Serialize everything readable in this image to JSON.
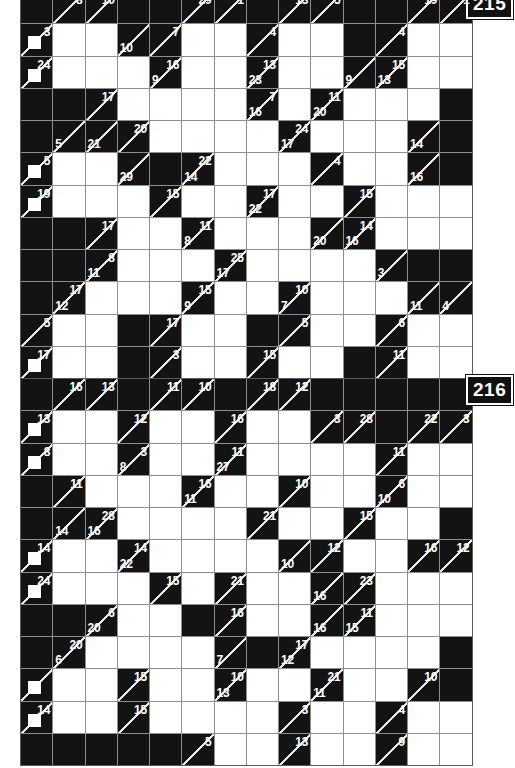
{
  "page": {
    "background_color": "#ffffff",
    "block_color": "#131313",
    "white_cell_color": "#ffffff",
    "grid_line_color": "#8e8e8e",
    "clue_text_color": "#ffffff"
  },
  "puzzles": [
    {
      "number": "215",
      "columns": 14,
      "rows": 12,
      "first_row_clipped": true,
      "cells": [
        [
          {
            "t": "b"
          },
          {
            "t": "c",
            "r": "8"
          },
          {
            "t": "c",
            "r": "10"
          },
          {
            "t": "b"
          },
          {
            "t": "b"
          },
          {
            "t": "c",
            "r": "29"
          },
          {
            "t": "c",
            "r": "1"
          },
          {
            "t": "b"
          },
          {
            "t": "c",
            "r": "13"
          },
          {
            "t": "c",
            "r": "5"
          },
          {
            "t": "b"
          },
          {
            "t": "b"
          },
          {
            "t": "c",
            "r": "19"
          },
          {
            "t": "c",
            "r": "1"
          }
        ],
        [
          {
            "t": "c",
            "r": "3",
            "nub": true
          },
          {
            "t": "w"
          },
          {
            "t": "w"
          },
          {
            "t": "c",
            "d": "10"
          },
          {
            "t": "c",
            "r": "7"
          },
          {
            "t": "w"
          },
          {
            "t": "w"
          },
          {
            "t": "c",
            "r": "4"
          },
          {
            "t": "w"
          },
          {
            "t": "w"
          },
          {
            "t": "b"
          },
          {
            "t": "c",
            "r": "4"
          },
          {
            "t": "w"
          },
          {
            "t": "w"
          }
        ],
        [
          {
            "t": "c",
            "r": "24",
            "nub": true
          },
          {
            "t": "w"
          },
          {
            "t": "w"
          },
          {
            "t": "w"
          },
          {
            "t": "c",
            "r": "16",
            "d": "9"
          },
          {
            "t": "w"
          },
          {
            "t": "w"
          },
          {
            "t": "c",
            "r": "13",
            "d": "23"
          },
          {
            "t": "w"
          },
          {
            "t": "w"
          },
          {
            "t": "c",
            "d": "9"
          },
          {
            "t": "c",
            "r": "15",
            "d": "13"
          },
          {
            "t": "w"
          },
          {
            "t": "w"
          }
        ],
        [
          {
            "t": "b"
          },
          {
            "t": "b"
          },
          {
            "t": "c",
            "r": "17"
          },
          {
            "t": "w"
          },
          {
            "t": "w"
          },
          {
            "t": "w"
          },
          {
            "t": "w"
          },
          {
            "t": "c",
            "r": "7",
            "d": "16"
          },
          {
            "t": "w"
          },
          {
            "t": "c",
            "r": "11",
            "d": "20"
          },
          {
            "t": "w"
          },
          {
            "t": "w"
          },
          {
            "t": "w"
          },
          {
            "t": "b"
          }
        ],
        [
          {
            "t": "b"
          },
          {
            "t": "c",
            "d": "5"
          },
          {
            "t": "c",
            "d": "21"
          },
          {
            "t": "c",
            "r": "20"
          },
          {
            "t": "w"
          },
          {
            "t": "w"
          },
          {
            "t": "w"
          },
          {
            "t": "w"
          },
          {
            "t": "c",
            "r": "24",
            "d": "17"
          },
          {
            "t": "w"
          },
          {
            "t": "w"
          },
          {
            "t": "w"
          },
          {
            "t": "c",
            "d": "14"
          },
          {
            "t": "b"
          }
        ],
        [
          {
            "t": "c",
            "r": "5",
            "nub": true
          },
          {
            "t": "w"
          },
          {
            "t": "w"
          },
          {
            "t": "c",
            "d": "29"
          },
          {
            "t": "b"
          },
          {
            "t": "c",
            "r": "22",
            "d": "14"
          },
          {
            "t": "w"
          },
          {
            "t": "w"
          },
          {
            "t": "w"
          },
          {
            "t": "c",
            "r": "4"
          },
          {
            "t": "w"
          },
          {
            "t": "w"
          },
          {
            "t": "c",
            "d": "16"
          },
          {
            "t": "b"
          }
        ],
        [
          {
            "t": "c",
            "r": "19",
            "nub": true
          },
          {
            "t": "w"
          },
          {
            "t": "w"
          },
          {
            "t": "w"
          },
          {
            "t": "c",
            "r": "15"
          },
          {
            "t": "w"
          },
          {
            "t": "w"
          },
          {
            "t": "c",
            "r": "17",
            "d": "22"
          },
          {
            "t": "w"
          },
          {
            "t": "w"
          },
          {
            "t": "c",
            "r": "15"
          },
          {
            "t": "w"
          },
          {
            "t": "w"
          },
          {
            "t": "w"
          }
        ],
        [
          {
            "t": "b"
          },
          {
            "t": "b"
          },
          {
            "t": "c",
            "r": "17"
          },
          {
            "t": "w"
          },
          {
            "t": "w"
          },
          {
            "t": "c",
            "r": "11",
            "d": "8"
          },
          {
            "t": "w"
          },
          {
            "t": "w"
          },
          {
            "t": "w"
          },
          {
            "t": "c",
            "d": "20"
          },
          {
            "t": "c",
            "r": "14",
            "d": "16"
          },
          {
            "t": "w"
          },
          {
            "t": "w"
          },
          {
            "t": "w"
          }
        ],
        [
          {
            "t": "b"
          },
          {
            "t": "b"
          },
          {
            "t": "c",
            "r": "8",
            "d": "11"
          },
          {
            "t": "w"
          },
          {
            "t": "w"
          },
          {
            "t": "w"
          },
          {
            "t": "c",
            "r": "25",
            "d": "17"
          },
          {
            "t": "w"
          },
          {
            "t": "w"
          },
          {
            "t": "w"
          },
          {
            "t": "w"
          },
          {
            "t": "c",
            "d": "3"
          },
          {
            "t": "b"
          },
          {
            "t": "b"
          }
        ],
        [
          {
            "t": "b"
          },
          {
            "t": "c",
            "r": "17",
            "d": "12"
          },
          {
            "t": "w"
          },
          {
            "t": "w"
          },
          {
            "t": "w"
          },
          {
            "t": "c",
            "r": "15",
            "d": "9"
          },
          {
            "t": "w"
          },
          {
            "t": "w"
          },
          {
            "t": "c",
            "r": "10",
            "d": "7"
          },
          {
            "t": "w"
          },
          {
            "t": "w"
          },
          {
            "t": "w"
          },
          {
            "t": "c",
            "d": "11"
          },
          {
            "t": "c",
            "d": "4"
          }
        ],
        [
          {
            "t": "c",
            "r": "5"
          },
          {
            "t": "w"
          },
          {
            "t": "w"
          },
          {
            "t": "b"
          },
          {
            "t": "c",
            "r": "17"
          },
          {
            "t": "w"
          },
          {
            "t": "w"
          },
          {
            "t": "b"
          },
          {
            "t": "c",
            "r": "5"
          },
          {
            "t": "w"
          },
          {
            "t": "w"
          },
          {
            "t": "c",
            "r": "6"
          },
          {
            "t": "w"
          },
          {
            "t": "w"
          }
        ],
        [
          {
            "t": "c",
            "r": "17",
            "nub": true
          },
          {
            "t": "w"
          },
          {
            "t": "w"
          },
          {
            "t": "b"
          },
          {
            "t": "c",
            "r": "3"
          },
          {
            "t": "w"
          },
          {
            "t": "w"
          },
          {
            "t": "c",
            "r": "15"
          },
          {
            "t": "w"
          },
          {
            "t": "w"
          },
          {
            "t": "b"
          },
          {
            "t": "c",
            "r": "11"
          },
          {
            "t": "w"
          },
          {
            "t": "w"
          }
        ]
      ]
    },
    {
      "number": "216",
      "columns": 14,
      "rows": 12,
      "first_row_clipped": false,
      "cells": [
        [
          {
            "t": "b"
          },
          {
            "t": "c",
            "r": "16"
          },
          {
            "t": "c",
            "r": "13"
          },
          {
            "t": "b"
          },
          {
            "t": "c",
            "r": "11"
          },
          {
            "t": "c",
            "r": "10"
          },
          {
            "t": "b"
          },
          {
            "t": "c",
            "r": "18"
          },
          {
            "t": "c",
            "r": "12"
          },
          {
            "t": "b"
          },
          {
            "t": "b"
          },
          {
            "t": "b"
          },
          {
            "t": "b"
          },
          {
            "t": "b"
          }
        ],
        [
          {
            "t": "c",
            "r": "13",
            "nub": true
          },
          {
            "t": "w"
          },
          {
            "t": "w"
          },
          {
            "t": "c",
            "r": "12"
          },
          {
            "t": "w"
          },
          {
            "t": "w"
          },
          {
            "t": "c",
            "r": "16"
          },
          {
            "t": "w"
          },
          {
            "t": "w"
          },
          {
            "t": "c",
            "r": "3"
          },
          {
            "t": "c",
            "r": "28"
          },
          {
            "t": "b"
          },
          {
            "t": "c",
            "r": "22"
          },
          {
            "t": "c",
            "r": "3"
          }
        ],
        [
          {
            "t": "c",
            "r": "8",
            "nub": true
          },
          {
            "t": "w"
          },
          {
            "t": "w"
          },
          {
            "t": "c",
            "r": "3",
            "d": "8"
          },
          {
            "t": "w"
          },
          {
            "t": "w"
          },
          {
            "t": "c",
            "r": "11",
            "d": "27"
          },
          {
            "t": "w"
          },
          {
            "t": "w"
          },
          {
            "t": "w"
          },
          {
            "t": "w"
          },
          {
            "t": "c",
            "r": "11"
          },
          {
            "t": "w"
          },
          {
            "t": "w"
          }
        ],
        [
          {
            "t": "b"
          },
          {
            "t": "c",
            "r": "11"
          },
          {
            "t": "w"
          },
          {
            "t": "w"
          },
          {
            "t": "w"
          },
          {
            "t": "c",
            "r": "16",
            "d": "11"
          },
          {
            "t": "w"
          },
          {
            "t": "w"
          },
          {
            "t": "c",
            "r": "10"
          },
          {
            "t": "w"
          },
          {
            "t": "w"
          },
          {
            "t": "c",
            "r": "6",
            "d": "10"
          },
          {
            "t": "w"
          },
          {
            "t": "w"
          }
        ],
        [
          {
            "t": "b"
          },
          {
            "t": "c",
            "d": "14"
          },
          {
            "t": "c",
            "r": "28",
            "d": "16"
          },
          {
            "t": "w"
          },
          {
            "t": "w"
          },
          {
            "t": "w"
          },
          {
            "t": "w"
          },
          {
            "t": "c",
            "r": "21"
          },
          {
            "t": "w"
          },
          {
            "t": "w"
          },
          {
            "t": "c",
            "r": "15"
          },
          {
            "t": "w"
          },
          {
            "t": "w"
          },
          {
            "t": "b"
          }
        ],
        [
          {
            "t": "c",
            "r": "14",
            "nub": true
          },
          {
            "t": "w"
          },
          {
            "t": "w"
          },
          {
            "t": "c",
            "r": "14",
            "d": "22"
          },
          {
            "t": "w"
          },
          {
            "t": "w"
          },
          {
            "t": "w"
          },
          {
            "t": "w"
          },
          {
            "t": "c",
            "d": "10"
          },
          {
            "t": "c",
            "r": "12"
          },
          {
            "t": "w"
          },
          {
            "t": "w"
          },
          {
            "t": "c",
            "r": "16"
          },
          {
            "t": "c",
            "r": "12"
          }
        ],
        [
          {
            "t": "c",
            "r": "24",
            "nub": true
          },
          {
            "t": "w"
          },
          {
            "t": "w"
          },
          {
            "t": "w"
          },
          {
            "t": "c",
            "r": "15"
          },
          {
            "t": "w"
          },
          {
            "t": "c",
            "r": "21"
          },
          {
            "t": "w"
          },
          {
            "t": "w"
          },
          {
            "t": "c",
            "d": "16"
          },
          {
            "t": "c",
            "r": "23"
          },
          {
            "t": "w"
          },
          {
            "t": "w"
          },
          {
            "t": "w"
          }
        ],
        [
          {
            "t": "b"
          },
          {
            "t": "b"
          },
          {
            "t": "c",
            "r": "6",
            "d": "20"
          },
          {
            "t": "w"
          },
          {
            "t": "w"
          },
          {
            "t": "b"
          },
          {
            "t": "c",
            "r": "16"
          },
          {
            "t": "w"
          },
          {
            "t": "w"
          },
          {
            "t": "c",
            "d": "16"
          },
          {
            "t": "c",
            "r": "11",
            "d": "15"
          },
          {
            "t": "w"
          },
          {
            "t": "w"
          },
          {
            "t": "w"
          }
        ],
        [
          {
            "t": "b"
          },
          {
            "t": "c",
            "r": "20",
            "d": "6"
          },
          {
            "t": "w"
          },
          {
            "t": "w"
          },
          {
            "t": "w"
          },
          {
            "t": "w"
          },
          {
            "t": "c",
            "d": "7"
          },
          {
            "t": "b"
          },
          {
            "t": "c",
            "r": "17",
            "d": "12"
          },
          {
            "t": "w"
          },
          {
            "t": "w"
          },
          {
            "t": "w"
          },
          {
            "t": "w"
          },
          {
            "t": "b"
          }
        ],
        [
          {
            "t": "c",
            "nub": true
          },
          {
            "t": "w"
          },
          {
            "t": "w"
          },
          {
            "t": "c",
            "r": "15"
          },
          {
            "t": "w"
          },
          {
            "t": "w"
          },
          {
            "t": "c",
            "r": "10",
            "d": "13"
          },
          {
            "t": "w"
          },
          {
            "t": "w"
          },
          {
            "t": "c",
            "r": "21",
            "d": "11"
          },
          {
            "t": "w"
          },
          {
            "t": "w"
          },
          {
            "t": "c",
            "r": "10"
          },
          {
            "t": "b"
          }
        ],
        [
          {
            "t": "c",
            "r": "14",
            "nub": true
          },
          {
            "t": "w"
          },
          {
            "t": "w"
          },
          {
            "t": "c",
            "r": "15"
          },
          {
            "t": "w"
          },
          {
            "t": "w"
          },
          {
            "t": "w"
          },
          {
            "t": "w"
          },
          {
            "t": "c",
            "r": "3"
          },
          {
            "t": "w"
          },
          {
            "t": "w"
          },
          {
            "t": "c",
            "r": "4"
          },
          {
            "t": "w"
          },
          {
            "t": "w"
          }
        ],
        [
          {
            "t": "b"
          },
          {
            "t": "b"
          },
          {
            "t": "b"
          },
          {
            "t": "b"
          },
          {
            "t": "b"
          },
          {
            "t": "c",
            "r": "5"
          },
          {
            "t": "w"
          },
          {
            "t": "w"
          },
          {
            "t": "c",
            "r": "13"
          },
          {
            "t": "w"
          },
          {
            "t": "w"
          },
          {
            "t": "c",
            "r": "9"
          },
          {
            "t": "w"
          },
          {
            "t": "w"
          }
        ]
      ]
    }
  ]
}
